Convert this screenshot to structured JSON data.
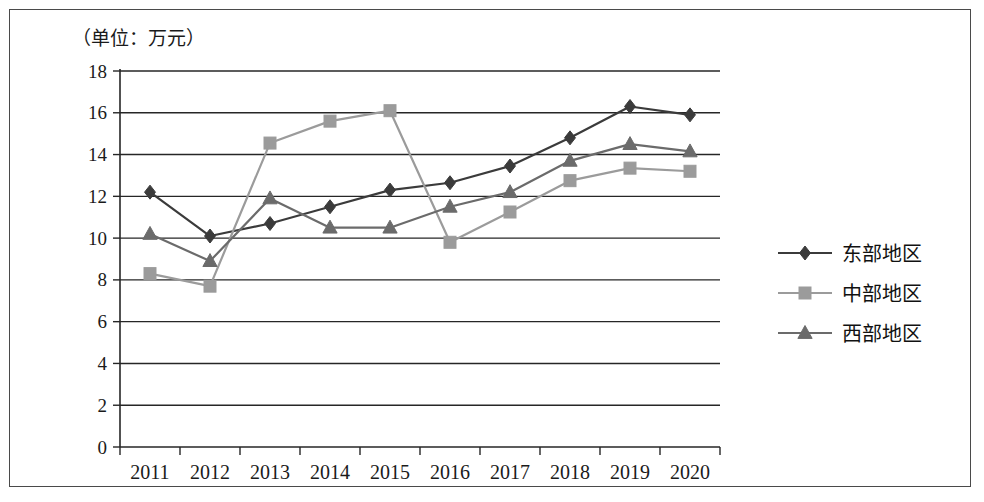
{
  "chart_data": {
    "type": "line",
    "title": "（单位：万元）",
    "xlabel": "",
    "ylabel": "",
    "unit_note": "（单位：万元）",
    "categories": [
      "2011",
      "2012",
      "2013",
      "2014",
      "2015",
      "2016",
      "2017",
      "2018",
      "2019",
      "2020"
    ],
    "x": [
      2011,
      2012,
      2013,
      2014,
      2015,
      2016,
      2017,
      2018,
      2019,
      2020
    ],
    "series": [
      {
        "name": "东部地区",
        "marker": "diamond",
        "color": "#3b3b3b",
        "values": [
          12.2,
          10.1,
          10.7,
          11.5,
          12.3,
          12.65,
          13.45,
          14.8,
          16.3,
          15.9
        ]
      },
      {
        "name": "中部地区",
        "marker": "square",
        "color": "#9b9b9b",
        "values": [
          8.3,
          7.7,
          14.55,
          15.6,
          16.1,
          9.8,
          11.25,
          12.75,
          13.35,
          13.2
        ]
      },
      {
        "name": "西部地区",
        "marker": "triangle",
        "color": "#6b6b6b",
        "values": [
          10.2,
          8.9,
          11.9,
          10.5,
          10.5,
          11.5,
          12.2,
          13.7,
          14.5,
          14.15
        ]
      }
    ],
    "ylim": [
      0,
      18
    ],
    "yticks": [
      0,
      2,
      4,
      6,
      8,
      10,
      12,
      14,
      16,
      18
    ],
    "ytick_labels": [
      "0",
      "2",
      "4",
      "6",
      "8",
      "10",
      "12",
      "14",
      "16",
      "18"
    ],
    "grid": true,
    "grid_axis": "y",
    "legend_position": "right"
  },
  "legend": {
    "entries": [
      {
        "label": "东部地区",
        "marker": "diamond",
        "color": "#3b3b3b"
      },
      {
        "label": "中部地区",
        "marker": "square",
        "color": "#9b9b9b"
      },
      {
        "label": "西部地区",
        "marker": "triangle",
        "color": "#6b6b6b"
      }
    ]
  },
  "colors": {
    "east": "#3b3b3b",
    "central": "#9b9b9b",
    "west": "#6b6b6b",
    "axis": "#262626",
    "text": "#1a1a1a",
    "frame": "#4a4a4a",
    "background": "#ffffff"
  }
}
